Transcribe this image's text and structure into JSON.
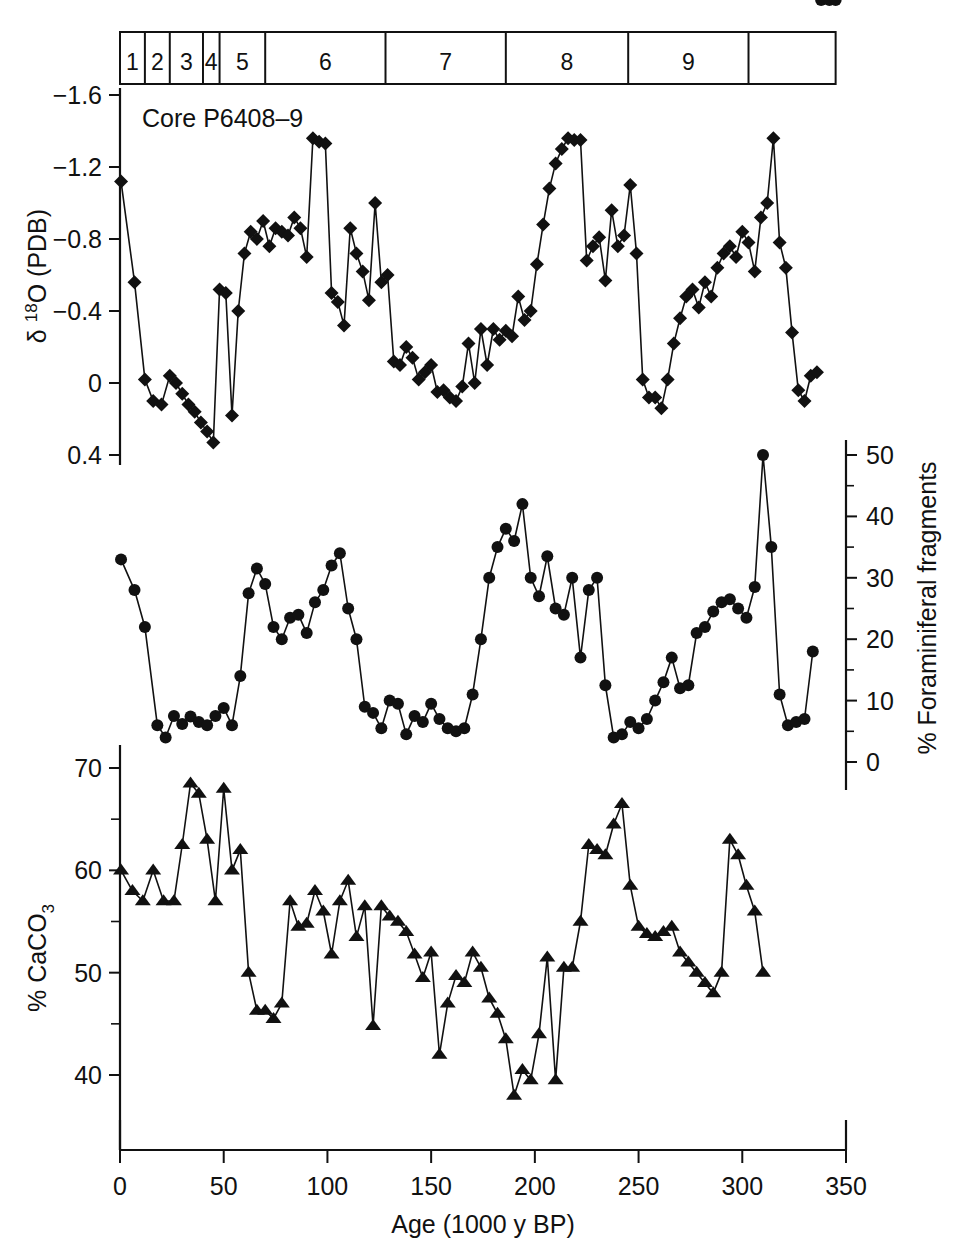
{
  "figure": {
    "core_label": "Core P6408–9",
    "background": "#ffffff",
    "ink": "#111111"
  },
  "stage_bar": {
    "name": "marine-isotope-stages",
    "labels": [
      "1",
      "2",
      "3",
      "4",
      "5",
      "6",
      "7",
      "8",
      "9"
    ],
    "boundaries_ka": [
      0,
      12,
      24,
      40,
      48,
      70,
      128,
      186,
      245,
      303,
      345
    ]
  },
  "axes": {
    "x": {
      "label": "Age (1000 y BP)",
      "ticks": [
        0,
        50,
        100,
        150,
        200,
        250,
        300,
        350
      ],
      "tick_labels": [
        "0",
        "50",
        "100",
        "150",
        "200",
        "250",
        "300",
        "350"
      ],
      "min": 0,
      "max": 350
    },
    "y_top": {
      "label_parts": {
        "delta": "δ",
        "sup": "18",
        "rest": "O (PDB)"
      },
      "label_plain": "δ 18O (PDB)",
      "ticks": [
        -1.6,
        -1.2,
        -0.8,
        -0.4,
        0,
        0.4
      ],
      "tick_labels": [
        "−1.6",
        "−1.2",
        "−0.8",
        "−0.4",
        "0",
        "0.4"
      ],
      "min": -1.75,
      "max": 0.42
    },
    "y_mid": {
      "label": "% Foraminiferal fragments",
      "ticks": [
        0,
        10,
        20,
        30,
        40,
        50
      ],
      "tick_labels": [
        "0",
        "10",
        "20",
        "30",
        "40",
        "50"
      ],
      "min": 0,
      "max": 52,
      "side": "right"
    },
    "y_bot": {
      "label_parts": {
        "pre": "% CaCO",
        "sub": "3"
      },
      "label_plain": "% CaCO3",
      "ticks": [
        40,
        50,
        60,
        70
      ],
      "tick_labels": [
        "40",
        "50",
        "60",
        "70"
      ],
      "minor_ticks": [
        45,
        55,
        65
      ],
      "min": 36,
      "max": 70.5
    }
  },
  "chart_data": {
    "type": "line",
    "xlabel": "Age (1000 y BP)",
    "panels": [
      {
        "id": "d18o",
        "ylabel": "δ 18O (PDB)",
        "ylim": [
          0.42,
          -1.75
        ],
        "y_inverted": true,
        "marker": "diamond",
        "x": [
          0.5,
          7,
          12,
          16,
          20,
          24,
          27,
          30,
          33,
          36,
          39,
          42,
          45,
          48,
          51,
          54,
          57,
          60,
          63,
          66,
          69,
          72,
          75,
          78,
          81,
          84,
          87,
          90,
          93,
          96,
          99,
          102,
          105,
          108,
          111,
          114,
          117,
          120,
          123,
          126,
          129,
          132,
          135,
          138,
          141,
          144,
          147,
          150,
          153,
          156,
          159,
          162,
          165,
          168,
          171,
          174,
          177,
          180,
          183,
          186,
          189,
          192,
          195,
          198,
          201,
          204,
          207,
          210,
          213,
          216,
          219,
          222,
          225,
          228,
          231,
          234,
          237,
          240,
          243,
          246,
          249,
          252,
          255,
          258,
          261,
          264,
          267,
          270,
          273,
          276,
          279,
          282,
          285,
          288,
          291,
          294,
          297,
          300,
          303,
          306,
          309,
          312,
          315,
          318,
          321,
          324,
          327,
          330,
          333,
          336,
          339,
          342,
          345
        ],
        "y": [
          -1.12,
          -0.56,
          -0.02,
          0.1,
          0.12,
          -0.04,
          0.0,
          0.06,
          0.12,
          0.16,
          0.22,
          0.27,
          0.33,
          -0.52,
          -0.5,
          0.18,
          -0.4,
          -0.72,
          -0.84,
          -0.8,
          -0.9,
          -0.76,
          -0.86,
          -0.84,
          -0.82,
          -0.92,
          -0.86,
          -0.7,
          -1.36,
          -1.34,
          -1.33,
          -0.5,
          -0.45,
          -0.32,
          -0.86,
          -0.72,
          -0.62,
          -0.46,
          -1.0,
          -0.56,
          -0.6,
          -0.12,
          -0.1,
          -0.2,
          -0.14,
          -0.02,
          -0.06,
          -0.1,
          0.05,
          0.04,
          0.08,
          0.1,
          0.02,
          -0.22,
          0.0,
          -0.3,
          -0.1,
          -0.3,
          -0.24,
          -0.29,
          -0.26,
          -0.48,
          -0.35,
          -0.4,
          -0.66,
          -0.88,
          -1.08,
          -1.22,
          -1.3,
          -1.36,
          -1.35,
          -1.35,
          -0.68,
          -0.76,
          -0.81,
          -0.57,
          -0.96,
          -0.76,
          -0.82,
          -1.1,
          -0.72,
          -0.02,
          0.08,
          0.08,
          0.14,
          -0.02,
          -0.22,
          -0.36,
          -0.48,
          -0.52,
          -0.42,
          -0.56,
          -0.48,
          -0.64,
          -0.72,
          -0.76,
          -0.7,
          -0.84,
          -0.78,
          -0.62,
          -0.92,
          -1.0,
          -1.36,
          -0.78,
          -0.64,
          -0.28,
          0.04,
          0.1,
          -0.04,
          -0.06
        ],
        "n_points": 113
      },
      {
        "id": "foram_fragments",
        "ylabel": "% Foraminiferal fragments",
        "ylim": [
          0,
          52
        ],
        "y_inverted": false,
        "marker": "circle",
        "x": [
          0.5,
          7,
          12,
          18,
          22,
          26,
          30,
          34,
          38,
          42,
          46,
          50,
          54,
          58,
          62,
          66,
          70,
          74,
          78,
          82,
          86,
          90,
          94,
          98,
          102,
          106,
          110,
          114,
          118,
          122,
          126,
          130,
          134,
          138,
          142,
          146,
          150,
          154,
          158,
          162,
          166,
          170,
          174,
          178,
          182,
          186,
          190,
          194,
          198,
          202,
          206,
          210,
          214,
          218,
          222,
          226,
          230,
          234,
          238,
          242,
          246,
          250,
          254,
          258,
          262,
          266,
          270,
          274,
          278,
          282,
          286,
          290,
          294,
          298,
          302,
          306,
          310,
          314,
          318,
          322,
          326,
          330,
          334,
          338,
          342,
          345
        ],
        "y": [
          33.0,
          28.0,
          22.0,
          6.0,
          4.0,
          7.5,
          6.2,
          7.4,
          6.5,
          6.0,
          7.5,
          8.8,
          6.0,
          14.0,
          27.5,
          31.5,
          29.0,
          22.0,
          20.0,
          23.5,
          24.0,
          21.0,
          26.0,
          28.0,
          32.0,
          34.0,
          25.0,
          20.0,
          9.0,
          8.0,
          5.5,
          10.0,
          9.5,
          4.5,
          7.5,
          6.5,
          9.5,
          7.0,
          5.5,
          5.0,
          5.5,
          11.0,
          20.0,
          30.0,
          35.0,
          38.0,
          36.0,
          42.0,
          30.0,
          27.0,
          33.5,
          25.0,
          24.0,
          30.0,
          17.0,
          28.0,
          30.0,
          12.5,
          4.0,
          4.5,
          6.5,
          5.5,
          7.0,
          10.0,
          13.0,
          17.0,
          12.0,
          12.5,
          21.0,
          22.0,
          24.5,
          26.0,
          26.5,
          25.0,
          23.5,
          28.5,
          50.0,
          35.0,
          11.0,
          6.0,
          6.5,
          7.0,
          18.0
        ],
        "n_points": 83
      },
      {
        "id": "caco3",
        "ylabel": "% CaCO3",
        "ylim": [
          36,
          70.5
        ],
        "y_inverted": false,
        "marker": "triangle",
        "x": [
          0.5,
          6,
          11,
          16,
          21,
          26,
          30,
          34,
          38,
          42,
          46,
          50,
          54,
          58,
          62,
          66,
          70,
          74,
          78,
          82,
          86,
          90,
          94,
          98,
          102,
          106,
          110,
          114,
          118,
          122,
          126,
          130,
          134,
          138,
          142,
          146,
          150,
          154,
          158,
          162,
          166,
          170,
          174,
          178,
          182,
          186,
          190,
          194,
          198,
          202,
          206,
          210,
          214,
          218,
          222,
          226,
          230,
          234,
          238,
          242,
          246,
          250,
          254,
          258,
          262,
          266,
          270,
          274,
          278,
          282,
          286,
          290,
          294,
          298,
          302,
          306,
          310,
          314,
          318,
          322,
          326,
          330,
          334,
          338,
          342,
          345
        ],
        "y": [
          60.0,
          58.0,
          57.0,
          60.0,
          57.0,
          57.0,
          62.5,
          68.5,
          67.5,
          63.0,
          57.0,
          68.0,
          60.0,
          62.0,
          50.0,
          46.3,
          46.3,
          45.5,
          47.0,
          57.0,
          54.5,
          54.8,
          58.0,
          56.0,
          51.8,
          57.0,
          59.0,
          53.5,
          56.5,
          44.8,
          56.5,
          55.5,
          55.0,
          54.0,
          51.8,
          49.5,
          52.0,
          42.0,
          47.0,
          49.7,
          49.0,
          52.0,
          50.5,
          47.5,
          46.0,
          43.5,
          38.0,
          40.5,
          39.5,
          44.0,
          51.5,
          39.5,
          50.5,
          50.5,
          55.0,
          62.5,
          62.0,
          61.5,
          64.5,
          66.5,
          58.5,
          54.5,
          53.8,
          53.5,
          54.0,
          54.5,
          52.0,
          51.0,
          50.0,
          49.0,
          48.0,
          50.0,
          63.0,
          61.5,
          58.5,
          56.0,
          50.0
        ],
        "n_points": 77
      }
    ]
  }
}
